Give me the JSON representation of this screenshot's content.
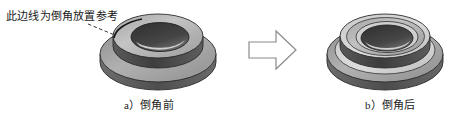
{
  "figure": {
    "background_color": "#ffffff",
    "width": 461,
    "height": 119
  },
  "annotation": {
    "text": "此边线为倒角放置参考",
    "leader_line": {
      "style": "dashed",
      "color": "#333333",
      "from_x": 88,
      "from_y": 24,
      "to_x": 134,
      "to_y": 43
    }
  },
  "arrow": {
    "name": "block-arrow-right",
    "direction": "right",
    "fill": "#ffffff",
    "stroke": "#8a8a8a"
  },
  "parts": [
    {
      "id": "before",
      "caption": "a）倒角前",
      "description": "法兰衬套三维模型，边线为尖角",
      "colors": {
        "bore": "#3c3c3c",
        "top_face": "#b4b4b4",
        "wall": "#4a4a4a",
        "flange_top": "#9a9a9a",
        "flange_side": "#5a5a5a",
        "highlight": "#d8d8d8",
        "outline": "#2b2b2b"
      }
    },
    {
      "id": "after",
      "caption": "b）倒角后",
      "description": "法兰衬套三维模型，边线已倒角",
      "colors": {
        "bore": "#3c3c3c",
        "top_face": "#b4b4b4",
        "wall": "#4a4a4a",
        "flange_top": "#9a9a9a",
        "flange_side": "#5a5a5a",
        "highlight": "#d8d8d8",
        "chamfer": "#c6c6c6",
        "outline": "#2b2b2b"
      }
    }
  ]
}
